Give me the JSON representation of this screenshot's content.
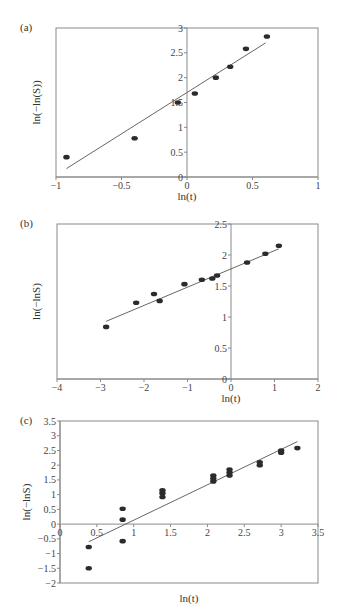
{
  "chart_data": [
    {
      "panel": "(a)",
      "type": "scatter",
      "xlabel": "ln(t)",
      "ylabel": "ln(−ln(S))",
      "xlim": [
        -1,
        1
      ],
      "ylim": [
        0,
        3
      ],
      "xticks": [
        -1,
        -0.5,
        0,
        0.5,
        1
      ],
      "xtick_labels": [
        "−1",
        "−0.5",
        "0",
        "0.5",
        "1"
      ],
      "yticks": [
        0,
        0.5,
        1,
        1.5,
        2,
        2.5,
        3
      ],
      "ytick_labels": [
        "0",
        "0.5",
        "1",
        "1.5",
        "2",
        "2.5",
        "3"
      ],
      "grid": false,
      "points": [
        [
          -0.92,
          0.4
        ],
        [
          -0.4,
          0.78
        ],
        [
          -0.07,
          1.5
        ],
        [
          0.06,
          1.68
        ],
        [
          0.22,
          2.0
        ],
        [
          0.33,
          2.22
        ],
        [
          0.45,
          2.58
        ],
        [
          0.61,
          2.83
        ]
      ],
      "fit_line": [
        [
          -0.92,
          0.17
        ],
        [
          0.6,
          2.7
        ]
      ],
      "frame": {
        "left": 56,
        "right": 318,
        "top": 28,
        "bottom": 177
      }
    },
    {
      "panel": "(b)",
      "type": "scatter",
      "xlabel": "ln(t)",
      "ylabel": "ln(−lnS)",
      "xlim": [
        -4,
        2
      ],
      "ylim": [
        0,
        2.5
      ],
      "xticks": [
        -4,
        -3,
        -2,
        -1,
        0,
        1,
        2
      ],
      "xtick_labels": [
        "−4",
        "−3",
        "−2",
        "−1",
        "0",
        "1",
        "2"
      ],
      "yticks": [
        0,
        0.5,
        1,
        1.5,
        2,
        2.5
      ],
      "ytick_labels": [
        "0",
        "0.5",
        "1",
        "1.5",
        "2",
        "2.5"
      ],
      "grid": false,
      "points": [
        [
          -2.87,
          0.84
        ],
        [
          -2.18,
          1.23
        ],
        [
          -1.77,
          1.37
        ],
        [
          -1.64,
          1.26
        ],
        [
          -1.07,
          1.53
        ],
        [
          -0.67,
          1.6
        ],
        [
          -0.43,
          1.62
        ],
        [
          -0.32,
          1.67
        ],
        [
          0.37,
          1.88
        ],
        [
          0.79,
          2.02
        ],
        [
          1.1,
          2.15
        ]
      ],
      "fit_line": [
        [
          -2.87,
          0.93
        ],
        [
          1.1,
          2.1
        ]
      ],
      "frame": {
        "left": 57,
        "right": 318,
        "top": 224,
        "bottom": 379
      }
    },
    {
      "panel": "(c)",
      "type": "scatter",
      "xlabel": "ln(t)",
      "ylabel": "ln(−lnS)",
      "xlim": [
        0,
        3.5
      ],
      "ylim": [
        -2,
        3.5
      ],
      "xticks": [
        0,
        0.5,
        1,
        1.5,
        2,
        2.5,
        3,
        3.5
      ],
      "xtick_labels": [
        "0",
        "0.5",
        "1",
        "1.5",
        "2",
        "2.5",
        "3",
        "3.5"
      ],
      "yticks": [
        -2,
        -1.5,
        -1,
        -0.5,
        0,
        0.5,
        1,
        1.5,
        2,
        2.5,
        3,
        3.5
      ],
      "ytick_labels": [
        "−2",
        "−1.5",
        "−1",
        "−0.5",
        "0",
        "0.5",
        "1",
        "1.5",
        "2",
        "2.5",
        "3",
        "3.5"
      ],
      "grid": false,
      "points": [
        [
          0.39,
          -0.78
        ],
        [
          0.39,
          -1.5
        ],
        [
          0.85,
          0.52
        ],
        [
          0.85,
          0.15
        ],
        [
          0.85,
          -0.58
        ],
        [
          1.39,
          1.15
        ],
        [
          1.39,
          1.05
        ],
        [
          1.39,
          0.92
        ],
        [
          2.08,
          1.65
        ],
        [
          2.08,
          1.55
        ],
        [
          2.08,
          1.45
        ],
        [
          2.3,
          1.85
        ],
        [
          2.3,
          1.75
        ],
        [
          2.3,
          1.65
        ],
        [
          2.71,
          2.1
        ],
        [
          2.71,
          2.0
        ],
        [
          3.0,
          2.5
        ],
        [
          3.0,
          2.42
        ],
        [
          3.22,
          2.58
        ]
      ],
      "fit_line": [
        [
          0.39,
          -0.6
        ],
        [
          3.22,
          2.8
        ]
      ],
      "frame": {
        "left": 60,
        "right": 318,
        "top": 421,
        "bottom": 583
      }
    }
  ]
}
